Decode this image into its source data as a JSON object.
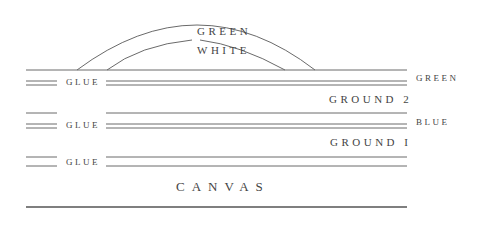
{
  "diagram": {
    "arc_labels": {
      "outer": "GREEN",
      "inner": "WHITE"
    },
    "right_labels": {
      "top": "GREEN",
      "middle": "BLUE"
    },
    "layers": [
      {
        "label": "GLUE"
      },
      {
        "label": "GROUND 2"
      },
      {
        "label": "GLUE"
      },
      {
        "label": "GROUND I"
      },
      {
        "label": "GLUE"
      },
      {
        "label": "CANVAS"
      }
    ],
    "line_color": "#666666"
  }
}
